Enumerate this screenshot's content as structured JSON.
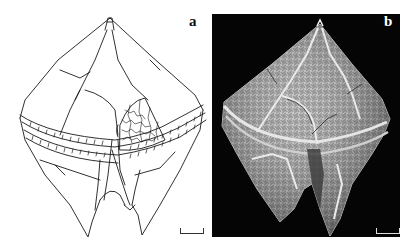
{
  "figure": {
    "panels": [
      {
        "id": "a",
        "label": "a",
        "kind": "line drawing",
        "subject": "dinoflagellate theca (peridinioid), ventral view, with reticulate plate ornament shown in one plate",
        "scale_bar": true
      },
      {
        "id": "b",
        "label": "b",
        "kind": "scanning electron micrograph",
        "subject": "dinoflagellate theca, ventral view, reticulate plate surface",
        "scale_bar": true
      }
    ],
    "colors": {
      "drawing_line": "#1a1a1a",
      "drawing_background": "#ffffff",
      "sem_background": "#050505",
      "sem_surface": "#9a9a9a",
      "sem_highlight": "#e6e6e6"
    }
  }
}
